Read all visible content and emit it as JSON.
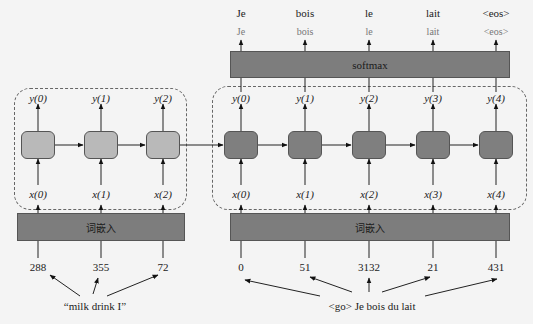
{
  "encoder": {
    "outputs": [
      "y(0)",
      "y(1)",
      "y(2)"
    ],
    "inputs": [
      "x(0)",
      "x(1)",
      "x(2)"
    ],
    "embedding_label": "词嵌入",
    "token_ids": [
      "288",
      "355",
      "72"
    ],
    "source_sentence": "“milk drink I”",
    "cell_color": "#b9b9b9"
  },
  "decoder": {
    "outputs": [
      "y(0)",
      "y(1)",
      "y(2)",
      "y(3)",
      "y(4)"
    ],
    "inputs": [
      "x(0)",
      "x(1)",
      "x(2)",
      "x(3)",
      "x(4)"
    ],
    "softmax_label": "softmax",
    "softmax_outputs": [
      "Je",
      "bois",
      "le",
      "lait",
      "<eos>"
    ],
    "final_words": [
      "Je",
      "bois",
      "le",
      "lait",
      "<eos>"
    ],
    "embedding_label": "词嵌入",
    "token_ids": [
      "0",
      "51",
      "3132",
      "21",
      "431"
    ],
    "target_sentence": "<go> Je bois du lait",
    "cell_color": "#7f7f7f"
  },
  "colors": {
    "bar": "#7d7d7d",
    "background": "#f4f4f4",
    "line": "#222222"
  }
}
